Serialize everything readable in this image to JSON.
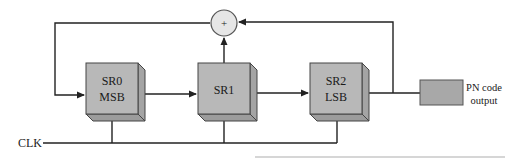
{
  "diagram": {
    "type": "linear feedback shift register (PN code generator)",
    "registers": [
      {
        "id": "SR0",
        "line1": "SR0",
        "line2": "MSB"
      },
      {
        "id": "SR1",
        "line1": "SR1",
        "line2": ""
      },
      {
        "id": "SR2",
        "line1": "SR2",
        "line2": "LSB"
      }
    ],
    "adder": {
      "symbol": "+"
    },
    "clock": {
      "label": "CLK"
    },
    "output": {
      "label_line1": "PN code",
      "label_line2": "output"
    },
    "colors": {
      "register_face": "#b8b8b8",
      "register_side": "#a4a4a4",
      "register_bottom": "#9c9c9c",
      "adder_fill": "#e6e6e6",
      "output_box": "#a8a8a8",
      "line": "#222222"
    }
  }
}
